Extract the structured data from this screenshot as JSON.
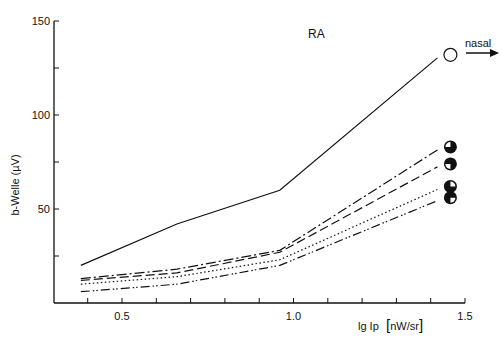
{
  "chart_data": {
    "type": "line",
    "title": "RA",
    "xlabel": "lg Ip [nW/sr]",
    "xlabel_parts": {
      "main": "lg Ip",
      "unit": "nW/sr"
    },
    "ylabel": "b-Welle (µV)",
    "xlim": [
      0.3,
      1.5
    ],
    "ylim": [
      0,
      150
    ],
    "x_ticks": [
      0.5,
      1.0,
      1.5
    ],
    "x_tick_labels": [
      "0.5",
      "1.0",
      "1.5"
    ],
    "y_ticks": [
      50,
      100,
      150
    ],
    "y_tick_labels": [
      "50",
      "100",
      "150"
    ],
    "grid": false,
    "annotation": "nasal",
    "x": [
      0.38,
      0.66,
      0.96,
      1.44
    ],
    "series": [
      {
        "name": "open circle (solid)",
        "style": "solid",
        "marker": "open-circle",
        "values": [
          20,
          42,
          60,
          132
        ]
      },
      {
        "name": "3/4 filled, upper-left open (long dash-dot)",
        "style": "dash-dot",
        "marker": "quarter-open-upper-left",
        "values": [
          13,
          18,
          28,
          83
        ]
      },
      {
        "name": "3/4 filled, lower-left open (dashed)",
        "style": "dashed",
        "marker": "quarter-open-lower-left",
        "values": [
          12,
          16,
          27,
          74
        ]
      },
      {
        "name": "half filled (dotted)",
        "style": "dotted",
        "marker": "half-filled",
        "values": [
          10,
          14,
          23,
          62
        ]
      },
      {
        "name": "3/4 filled, lower-right open (dash-dot-dot)",
        "style": "dash-dot-dot",
        "marker": "quarter-open-lower-right",
        "values": [
          6,
          10,
          20,
          56
        ]
      }
    ]
  }
}
